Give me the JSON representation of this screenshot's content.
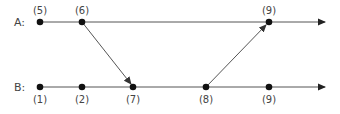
{
  "diagram": {
    "type": "space-time message diagram",
    "colors": {
      "line": "#555555",
      "dot": "#111111",
      "text": "#444444"
    },
    "processes": [
      {
        "name": "A",
        "label": "A:",
        "y": 22
      },
      {
        "name": "B",
        "label": "B:",
        "y": 87
      }
    ],
    "events": [
      {
        "process": "A",
        "label": "(5)",
        "x": 40
      },
      {
        "process": "A",
        "label": "(6)",
        "x": 82
      },
      {
        "process": "A",
        "label": "(9)",
        "x": 269
      },
      {
        "process": "B",
        "label": "(1)",
        "x": 40
      },
      {
        "process": "B",
        "label": "(2)",
        "x": 82
      },
      {
        "process": "B",
        "label": "(7)",
        "x": 133
      },
      {
        "process": "B",
        "label": "(8)",
        "x": 206
      },
      {
        "process": "B",
        "label": "(9)",
        "x": 269
      }
    ],
    "messages": [
      {
        "from": "A(6)",
        "to": "B(7)"
      },
      {
        "from": "B(8)",
        "to": "A(9)"
      }
    ]
  }
}
